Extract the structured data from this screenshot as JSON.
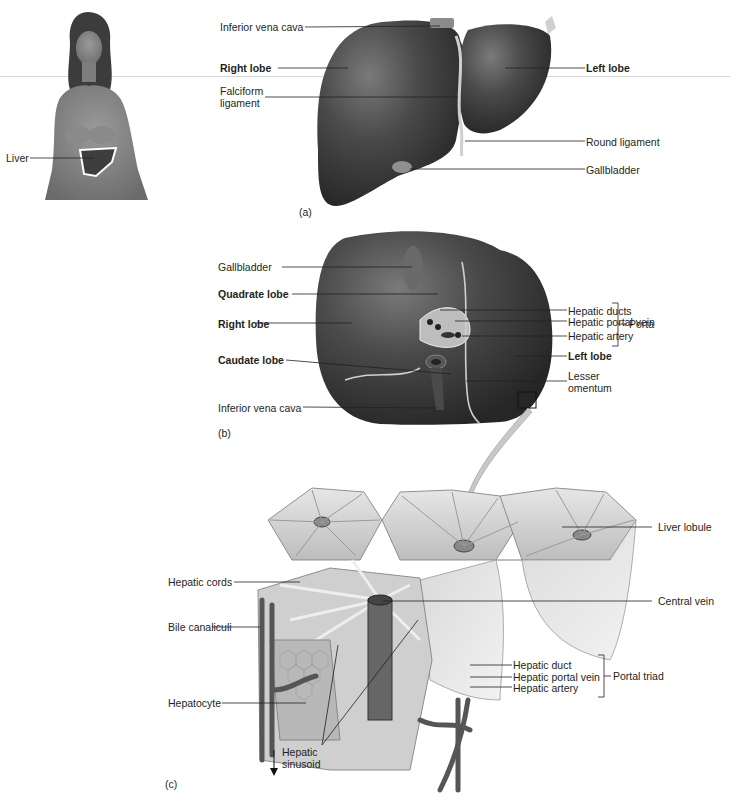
{
  "figure": {
    "panels": {
      "a": {
        "tag": "(a)",
        "inset_label": "Liver",
        "labels_left": [
          "Inferior vena cava",
          "Right lobe",
          "Falciform ligament"
        ],
        "labels_right": [
          "Left lobe",
          "Round ligament",
          "Gallbladder"
        ],
        "inferior_vena_cava": "Inferior vena cava",
        "right_lobe": "Right lobe",
        "falciform_1": "Falciform",
        "falciform_2": "ligament",
        "left_lobe": "Left lobe",
        "round_ligament": "Round ligament",
        "gallbladder": "Gallbladder"
      },
      "b": {
        "tag": "(b)",
        "gallbladder": "Gallbladder",
        "quadrate_lobe": "Quadrate lobe",
        "right_lobe": "Right lobe",
        "caudate_lobe": "Caudate lobe",
        "inferior_vena_cava": "Inferior vena cava",
        "hepatic_ducts": "Hepatic ducts",
        "hepatic_portal_vein": "Hepatic portal vein",
        "hepatic_artery": "Hepatic artery",
        "porta": "Porta",
        "left_lobe": "Left lobe",
        "lesser_1": "Lesser",
        "lesser_2": "omentum"
      },
      "c": {
        "tag": "(c)",
        "liver_lobule": "Liver lobule",
        "hepatic_cords": "Hepatic cords",
        "central_vein": "Central vein",
        "bile_canaliculi": "Bile canaliculi",
        "hepatic_duct": "Hepatic duct",
        "hepatic_portal_vein": "Hepatic portal vein",
        "hepatic_artery": "Hepatic artery",
        "portal_triad": "Portal triad",
        "hepatocyte": "Hepatocyte",
        "sinusoid_1": "Hepatic",
        "sinusoid_2": "sinusoid"
      }
    },
    "colors": {
      "organ_dark": "#3a3a3a",
      "organ_mid": "#5a5a5a",
      "lobule_light": "#d8d8d8",
      "leader_line": "#231f20",
      "arrow": "#c8c8c8"
    }
  }
}
